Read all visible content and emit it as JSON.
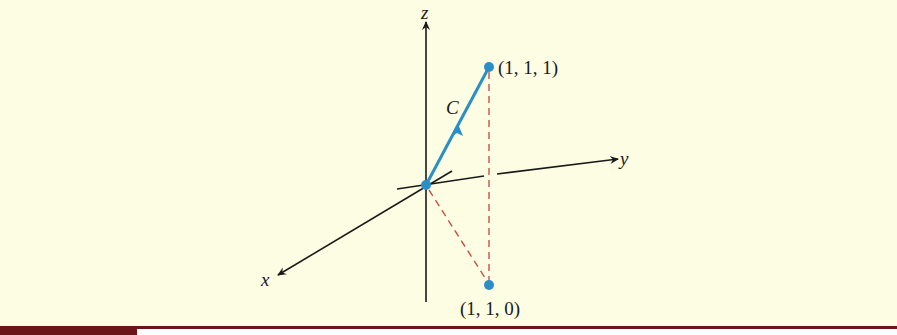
{
  "figure": {
    "axes": {
      "x_label": "x",
      "y_label": "y",
      "z_label": "z"
    },
    "curve": {
      "label": "C",
      "start": "(0, 0, 0)",
      "end": "(1, 1, 1)"
    },
    "points": [
      {
        "label": "(1, 1, 1)"
      },
      {
        "label": "(1, 1, 0)"
      }
    ],
    "colors": {
      "background": "#fdfde3",
      "axis": "#1a1a1a",
      "curve": "#2a8fc8",
      "dashed": "#c8504a",
      "rule": "#6b1518"
    }
  }
}
